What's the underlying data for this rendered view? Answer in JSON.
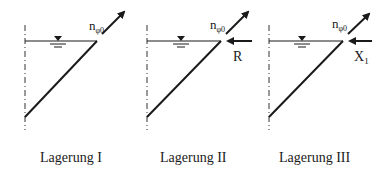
{
  "diagram": {
    "panels": [
      {
        "id": "lagerung-1",
        "caption": "Lagerung I",
        "force_label": "n",
        "force_subscript": "φ0",
        "reaction_label": null
      },
      {
        "id": "lagerung-2",
        "caption": "Lagerung II",
        "force_label": "n",
        "force_subscript": "φ0",
        "reaction_label": "R"
      },
      {
        "id": "lagerung-3",
        "caption": "Lagerung III",
        "force_label": "n",
        "force_subscript": "φ0",
        "reaction_label": "X",
        "reaction_subscript": "1"
      }
    ],
    "symbols": {
      "water_level": "water-surface-triangle",
      "axis": "dash-dot-symmetry-axis"
    },
    "colors": {
      "line": "#1a1a1a",
      "background": "#ffffff"
    }
  }
}
